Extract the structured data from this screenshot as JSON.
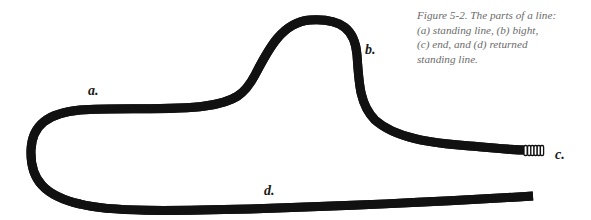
{
  "figure": {
    "caption_lines": [
      "Figure 5-2. The parts of a line:",
      "(a) standing line, (b) bight,",
      "(c) end, and (d) returned",
      "standing line."
    ],
    "labels": {
      "a": "a.",
      "b": "b.",
      "c": "c.",
      "d": "d."
    },
    "parts": [
      {
        "key": "a",
        "name": "standing line"
      },
      {
        "key": "b",
        "name": "bight"
      },
      {
        "key": "c",
        "name": "end"
      },
      {
        "key": "d",
        "name": "returned standing line"
      }
    ],
    "colors": {
      "rope": "#111111",
      "caption": "#6b6b6b",
      "labels": "#1a1a1a",
      "background": "#ffffff"
    }
  }
}
